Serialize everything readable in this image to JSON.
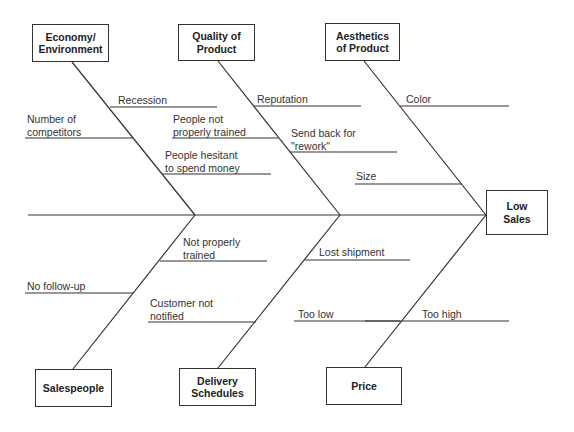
{
  "diagram": {
    "type": "fishbone",
    "effect": {
      "label": "Low\nSales",
      "x": 486,
      "y": 190,
      "w": 62,
      "h": 45
    },
    "spine": {
      "x1": 28,
      "y1": 215,
      "x2": 486,
      "y2": 215
    },
    "categories": [
      {
        "id": "economy",
        "label": "Economy/\nEnvironment",
        "x": 32,
        "y": 24,
        "w": 77,
        "h": 38,
        "bone": {
          "x1": 72,
          "y1": 62,
          "x2": 195,
          "y2": 215
        }
      },
      {
        "id": "quality",
        "label": "Quality of\nProduct",
        "x": 178,
        "y": 24,
        "w": 77,
        "h": 37,
        "bone": {
          "x1": 218,
          "y1": 61,
          "x2": 340,
          "y2": 215
        }
      },
      {
        "id": "aesthetics",
        "label": "Aesthetics\nof Product",
        "x": 325,
        "y": 23,
        "w": 75,
        "h": 38,
        "bone": {
          "x1": 364,
          "y1": 61,
          "x2": 486,
          "y2": 215
        }
      },
      {
        "id": "salespeople",
        "label": "Salespeople",
        "x": 35,
        "y": 369,
        "w": 77,
        "h": 38,
        "bone": {
          "x1": 73,
          "y1": 369,
          "x2": 195,
          "y2": 215
        }
      },
      {
        "id": "delivery",
        "label": "Delivery\nSchedules",
        "x": 179,
        "y": 368,
        "w": 77,
        "h": 38,
        "bone": {
          "x1": 218,
          "y1": 368,
          "x2": 340,
          "y2": 215
        }
      },
      {
        "id": "price",
        "label": "Price",
        "x": 326,
        "y": 367,
        "w": 76,
        "h": 38,
        "bone": {
          "x1": 365,
          "y1": 367,
          "x2": 486,
          "y2": 215
        }
      }
    ],
    "causes": [
      {
        "category": "economy",
        "label": "Recession",
        "tx": 118,
        "ty": 94,
        "line": {
          "x1": 110,
          "x2": 217,
          "y": 107
        }
      },
      {
        "category": "economy",
        "label": "Number of\ncompetitors",
        "tx": 27,
        "ty": 113,
        "line": {
          "x1": 25,
          "x2": 133,
          "y": 138
        }
      },
      {
        "category": "economy",
        "label": "People hesitant\nto spend money",
        "tx": 165,
        "ty": 149,
        "line": {
          "x1": 163,
          "x2": 271,
          "y": 174
        }
      },
      {
        "category": "quality",
        "label": "Reputation",
        "tx": 257,
        "ty": 93,
        "line": {
          "x1": 254,
          "x2": 361,
          "y": 106
        }
      },
      {
        "category": "quality",
        "label": "People not\nproperly trained",
        "tx": 173,
        "ty": 113,
        "line": {
          "x1": 172,
          "x2": 278,
          "y": 138
        }
      },
      {
        "category": "quality",
        "label": "Send back for\n\"rework\"",
        "tx": 291,
        "ty": 127,
        "line": {
          "x1": 290,
          "x2": 397,
          "y": 152
        }
      },
      {
        "category": "aesthetics",
        "label": "Color",
        "tx": 406,
        "ty": 93,
        "line": {
          "x1": 400,
          "x2": 509,
          "y": 106
        }
      },
      {
        "category": "aesthetics",
        "label": "Size",
        "tx": 356,
        "ty": 170,
        "line": {
          "x1": 355,
          "x2": 462,
          "y": 184
        }
      },
      {
        "category": "salespeople",
        "label": "Not properly\ntrained",
        "tx": 183,
        "ty": 236,
        "line": {
          "x1": 160,
          "x2": 267,
          "y": 261
        }
      },
      {
        "category": "salespeople",
        "label": "No follow-up",
        "tx": 27,
        "ty": 280,
        "line": {
          "x1": 25,
          "x2": 133,
          "y": 293
        }
      },
      {
        "category": "delivery",
        "label": "Lost shipment",
        "tx": 319,
        "ty": 246,
        "line": {
          "x1": 305,
          "x2": 410,
          "y": 260
        }
      },
      {
        "category": "delivery",
        "label": "Customer not\nnotified",
        "tx": 150,
        "ty": 297,
        "line": {
          "x1": 148,
          "x2": 256,
          "y": 322
        }
      },
      {
        "category": "price",
        "label": "Too low",
        "tx": 298,
        "ty": 308,
        "line": {
          "x1": 294,
          "x2": 400,
          "y": 321
        }
      },
      {
        "category": "price",
        "label": "Too high",
        "tx": 422,
        "ty": 308,
        "line": {
          "x1": 365,
          "x2": 509,
          "y": 321
        }
      }
    ],
    "colors": {
      "line": "#333333",
      "text": "#333333",
      "background": "#ffffff"
    }
  }
}
